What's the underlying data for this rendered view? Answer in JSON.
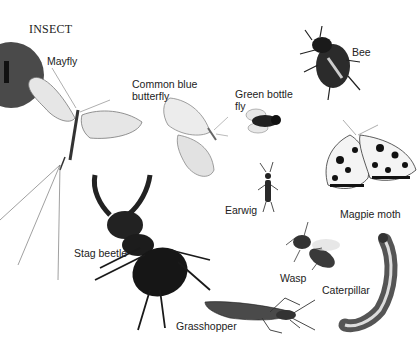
{
  "page": {
    "heading": "INSECT",
    "tab_letter": "I",
    "tab_color": "#4a4a4a"
  },
  "insects": [
    {
      "name": "Mayfly"
    },
    {
      "name": "Common blue butterfly",
      "line1": "Common blue",
      "line2": "butterfly"
    },
    {
      "name": "Green bottle fly",
      "line1": "Green bottle",
      "line2": "fly"
    },
    {
      "name": "Bee"
    },
    {
      "name": "Magpie moth"
    },
    {
      "name": "Earwig"
    },
    {
      "name": "Stag beetle"
    },
    {
      "name": "Wasp"
    },
    {
      "name": "Caterpillar"
    },
    {
      "name": "Grasshopper"
    }
  ]
}
